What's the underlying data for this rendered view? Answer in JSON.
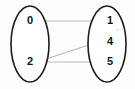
{
  "diagram": {
    "type": "mapping-diagram",
    "background_color": "#fdfdfd",
    "ellipse_stroke_color": "#1c1c1c",
    "arrow_color": "#b9b9b9",
    "arrowhead_color": "#9a9a9a",
    "label_color": "#141414",
    "domain_set": {
      "name": "domain-ellipse",
      "cx": 30,
      "cy": 44,
      "rx": 19,
      "ry": 38,
      "elements": [
        {
          "label": "0",
          "x": 30,
          "y": 21
        },
        {
          "label": "2",
          "x": 30,
          "y": 62
        }
      ]
    },
    "codomain_set": {
      "name": "codomain-ellipse",
      "cx": 107,
      "cy": 44,
      "rx": 19,
      "ry": 38,
      "elements": [
        {
          "label": "1",
          "x": 110,
          "y": 21
        },
        {
          "label": "4",
          "x": 110,
          "y": 42
        },
        {
          "label": "5",
          "x": 110,
          "y": 62
        }
      ]
    },
    "arrows": [
      {
        "name": "arrow-0-to-1",
        "from": "0",
        "to": "1",
        "x1": 38,
        "y1": 21,
        "x2": 98,
        "y2": 21
      },
      {
        "name": "arrow-2-to-4",
        "from": "2",
        "to": "4",
        "x1": 37,
        "y1": 62,
        "x2": 98,
        "y2": 42
      },
      {
        "name": "arrow-2-to-5",
        "from": "2",
        "to": "5",
        "x1": 38,
        "y1": 62,
        "x2": 98,
        "y2": 62
      }
    ],
    "speck": {
      "name": "speck-mark",
      "cx": 117,
      "cy": 30,
      "r": 0.9
    }
  }
}
